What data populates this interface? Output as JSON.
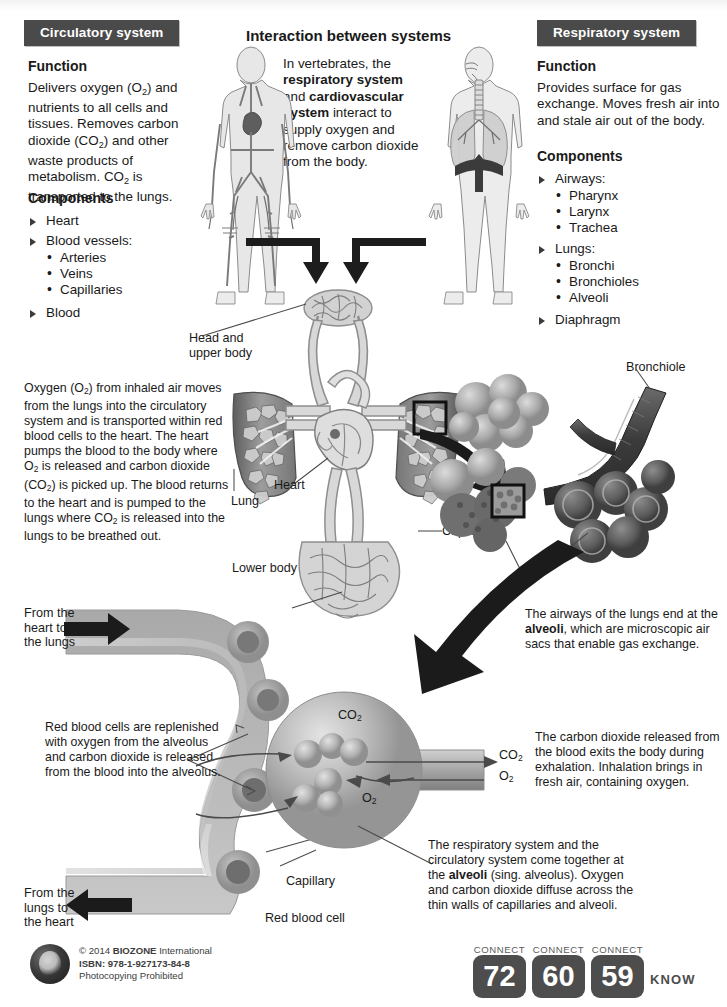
{
  "page": {
    "title": "Interaction between systems"
  },
  "circulatory": {
    "header": "Circulatory system",
    "function_heading": "Function",
    "function_text_parts": [
      "Delivers oxygen (O",
      "2",
      ") and nutrients to all cells and tissues. Removes carbon dioxide (CO",
      "2",
      ") and other waste products of metabolism. CO",
      "2",
      " is transported to the lungs."
    ],
    "components_heading": "Components",
    "components": [
      {
        "label": "Heart",
        "sub": []
      },
      {
        "label": "Blood vessels:",
        "sub": [
          "Arteries",
          "Veins",
          "Capillaries"
        ]
      },
      {
        "label": "Blood",
        "sub": []
      }
    ]
  },
  "respiratory": {
    "header": "Respiratory system",
    "function_heading": "Function",
    "function_text": "Provides surface for gas exchange. Moves fresh air into and stale air out of the body.",
    "components_heading": "Components",
    "components": [
      {
        "label": "Airways:",
        "sub": [
          "Pharynx",
          "Larynx",
          "Trachea"
        ]
      },
      {
        "label": "Lungs:",
        "sub": [
          "Bronchi",
          "Bronchioles",
          "Alveoli"
        ]
      },
      {
        "label": "Diaphragm",
        "sub": []
      }
    ]
  },
  "intro": {
    "line1": "In vertebrates, the",
    "bold1": "respiratory system",
    "line2": "and",
    "bold2": "cardiovascular",
    "bold3": "system",
    "line3": "interact to",
    "line4": "supply oxygen and",
    "line5": "remove carbon dioxide",
    "line6": "from the body."
  },
  "transport_paragraph": {
    "text": "Oxygen (O2) from inhaled air moves from the lungs into the circulatory system and is transported within red blood cells to the heart. The heart pumps the blood to the body where O2 is released and carbon dioxide (CO2) is picked up. The blood returns to the heart and is pumped to the lungs where CO2 is released into the lungs to be breathed out."
  },
  "diagram_labels": {
    "head_upper_body": "Head and\nupper body",
    "head_upper_body_l1": "Head and",
    "head_upper_body_l2": "upper body",
    "lung_left": "Lung",
    "lung_right": "Lung",
    "heart": "Heart",
    "lower_body": "Lower body",
    "bronchiole": "Bronchiole",
    "capillaries": "Capillaries",
    "capillary": "Capillary",
    "red_blood_cell": "Red blood cell",
    "co2": "CO",
    "co2_sub": "2",
    "o2": "O",
    "o2_sub": "2",
    "from_heart_to_lungs_l1": "From the",
    "from_heart_to_lungs_l2": "heart to",
    "from_heart_to_lungs_l3": "the lungs",
    "from_lungs_to_heart_l1": "From the",
    "from_lungs_to_heart_l2": "lungs to",
    "from_lungs_to_heart_l3": "the heart"
  },
  "alveoli_note": {
    "l1": "The airways of the lungs",
    "l2a": "end at the ",
    "l2b": "alveoli",
    "l2c": ", which",
    "l3": "are microscopic air sacs that",
    "l4": "enable gas exchange."
  },
  "rbc_note": {
    "l1": "Red blood cells are",
    "l2": "replenished with oxygen",
    "l3": "from the alveolus",
    "l4": "and carbon dioxide is",
    "l5": "released from the blood",
    "l6": "into the alveolus."
  },
  "exhalation_note": {
    "l1": "The carbon dioxide released",
    "l2": "from the blood exits the",
    "l3": "body during exhalation.",
    "l4": "Inhalation brings in fresh air,",
    "l5": "containing oxygen."
  },
  "together_note": {
    "l1": "The respiratory system and the",
    "l2": "circulatory system come together",
    "l3a": "at the ",
    "l3b": "alveoli",
    "l3c": " (sing. alveolus).",
    "l4": "Oxygen and carbon dioxide",
    "l5": "diffuse across the thin walls of",
    "l6": "capillaries and alveoli."
  },
  "footer": {
    "copyright_pre": "© 2014 ",
    "copyright_brand": "BIOZONE",
    "copyright_post": " International",
    "isbn": "ISBN: 978-1-927173-84-8",
    "photocopying": "Photocopying Prohibited",
    "connect_label": "CONNECT",
    "connect_numbers": [
      "72",
      "60",
      "59"
    ],
    "know": "KNOW"
  },
  "colors": {
    "header_bar": "#4a4a4a",
    "connect_box": "#4d4d4d",
    "ink": "#1a1a1a"
  }
}
